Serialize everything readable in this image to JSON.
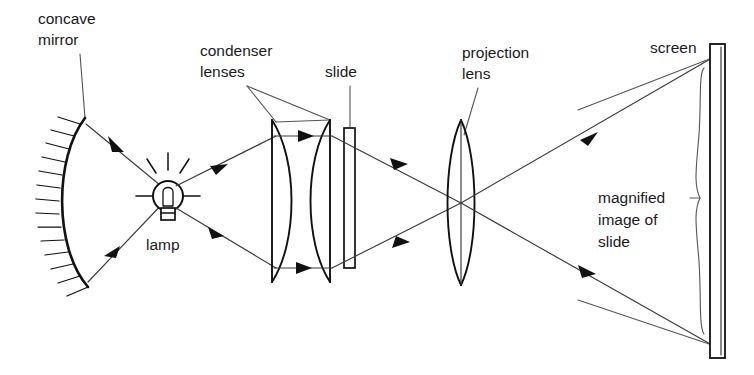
{
  "diagram": {
    "background_color": "#ffffff",
    "ink_color": "#111111",
    "ray_color": "#3a3a3a",
    "labels": {
      "concave_mirror_line1": "concave",
      "concave_mirror_line2": "mirror",
      "condenser_line1": "condenser",
      "condenser_line2": "lenses",
      "slide": "slide",
      "projection_line1": "projection",
      "projection_line2": "lens",
      "screen": "screen",
      "lamp": "lamp",
      "magnified_line1": "magnified",
      "magnified_line2": "image of",
      "magnified_line3": "slide"
    },
    "components": [
      {
        "name": "concave-mirror",
        "kind": "mirror",
        "x": 60,
        "y_top": 116,
        "y_bottom": 288
      },
      {
        "name": "lamp",
        "kind": "light-source",
        "x": 168,
        "y": 196
      },
      {
        "name": "condenser-lens-1",
        "kind": "plano-convex-lens",
        "x": 274,
        "y_top": 120,
        "y_bottom": 282
      },
      {
        "name": "condenser-lens-2",
        "kind": "plano-convex-lens",
        "x": 322,
        "y_top": 120,
        "y_bottom": 282
      },
      {
        "name": "slide",
        "kind": "transparency",
        "x": 348,
        "y_top": 128,
        "y_bottom": 268
      },
      {
        "name": "projection-lens",
        "kind": "biconvex-lens",
        "x": 461,
        "y_top": 120,
        "y_bottom": 285
      },
      {
        "name": "screen",
        "kind": "projection-screen",
        "x": 712,
        "y_top": 44,
        "y_bottom": 358
      }
    ],
    "rays": [
      {
        "name": "mirror-reflected-upper",
        "from": "mirror-top",
        "to": "lamp"
      },
      {
        "name": "mirror-reflected-lower",
        "from": "mirror-bottom",
        "to": "lamp"
      },
      {
        "name": "lamp-to-condenser-upper",
        "from": "lamp",
        "to": "condenser-top"
      },
      {
        "name": "lamp-to-condenser-lower",
        "from": "lamp",
        "to": "condenser-bottom"
      },
      {
        "name": "condenser-parallel-upper",
        "from": "condenser-lens-1",
        "to": "condenser-lens-2"
      },
      {
        "name": "condenser-parallel-lower",
        "from": "condenser-lens-1",
        "to": "condenser-lens-2"
      },
      {
        "name": "converging-upper",
        "from": "condenser-lens-2",
        "to": "projection-lens-center"
      },
      {
        "name": "converging-lower",
        "from": "condenser-lens-2",
        "to": "projection-lens-center"
      },
      {
        "name": "projected-upper",
        "from": "projection-lens-center",
        "to": "screen-top"
      },
      {
        "name": "projected-lower",
        "from": "projection-lens-center",
        "to": "screen-bottom"
      }
    ],
    "annotations": [
      {
        "name": "magnified-image-brace",
        "spans": "screen-top to screen-bottom"
      }
    ]
  }
}
